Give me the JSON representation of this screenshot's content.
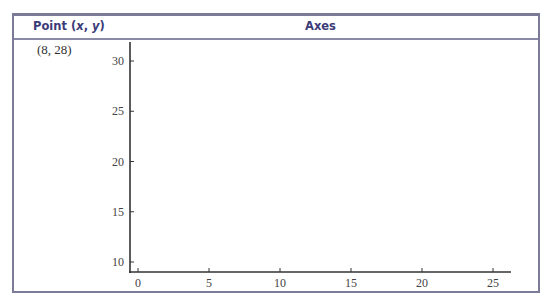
{
  "table": {
    "headers": {
      "point_prefix": "Point (",
      "point_x": "x",
      "point_sep": ", ",
      "point_y": "y",
      "point_suffix": ")",
      "axes": "Axes"
    },
    "rows": [
      {
        "point": "(8, 28)"
      }
    ]
  },
  "colors": {
    "border": "#7b7b98",
    "header_text": "#3b3b78",
    "axis": "#333333"
  },
  "chart_data": {
    "type": "scatter",
    "title": "",
    "xlabel": "",
    "ylabel": "",
    "x_ticks": [
      0,
      5,
      10,
      15,
      20,
      25
    ],
    "y_ticks": [
      10,
      15,
      20,
      25,
      30
    ],
    "xlim": [
      -0.5,
      26.5
    ],
    "ylim": [
      9,
      32
    ],
    "grid": false,
    "series": [
      {
        "name": "Point",
        "points": [],
        "note": "blank axes for plotting (8, 28)"
      }
    ]
  }
}
